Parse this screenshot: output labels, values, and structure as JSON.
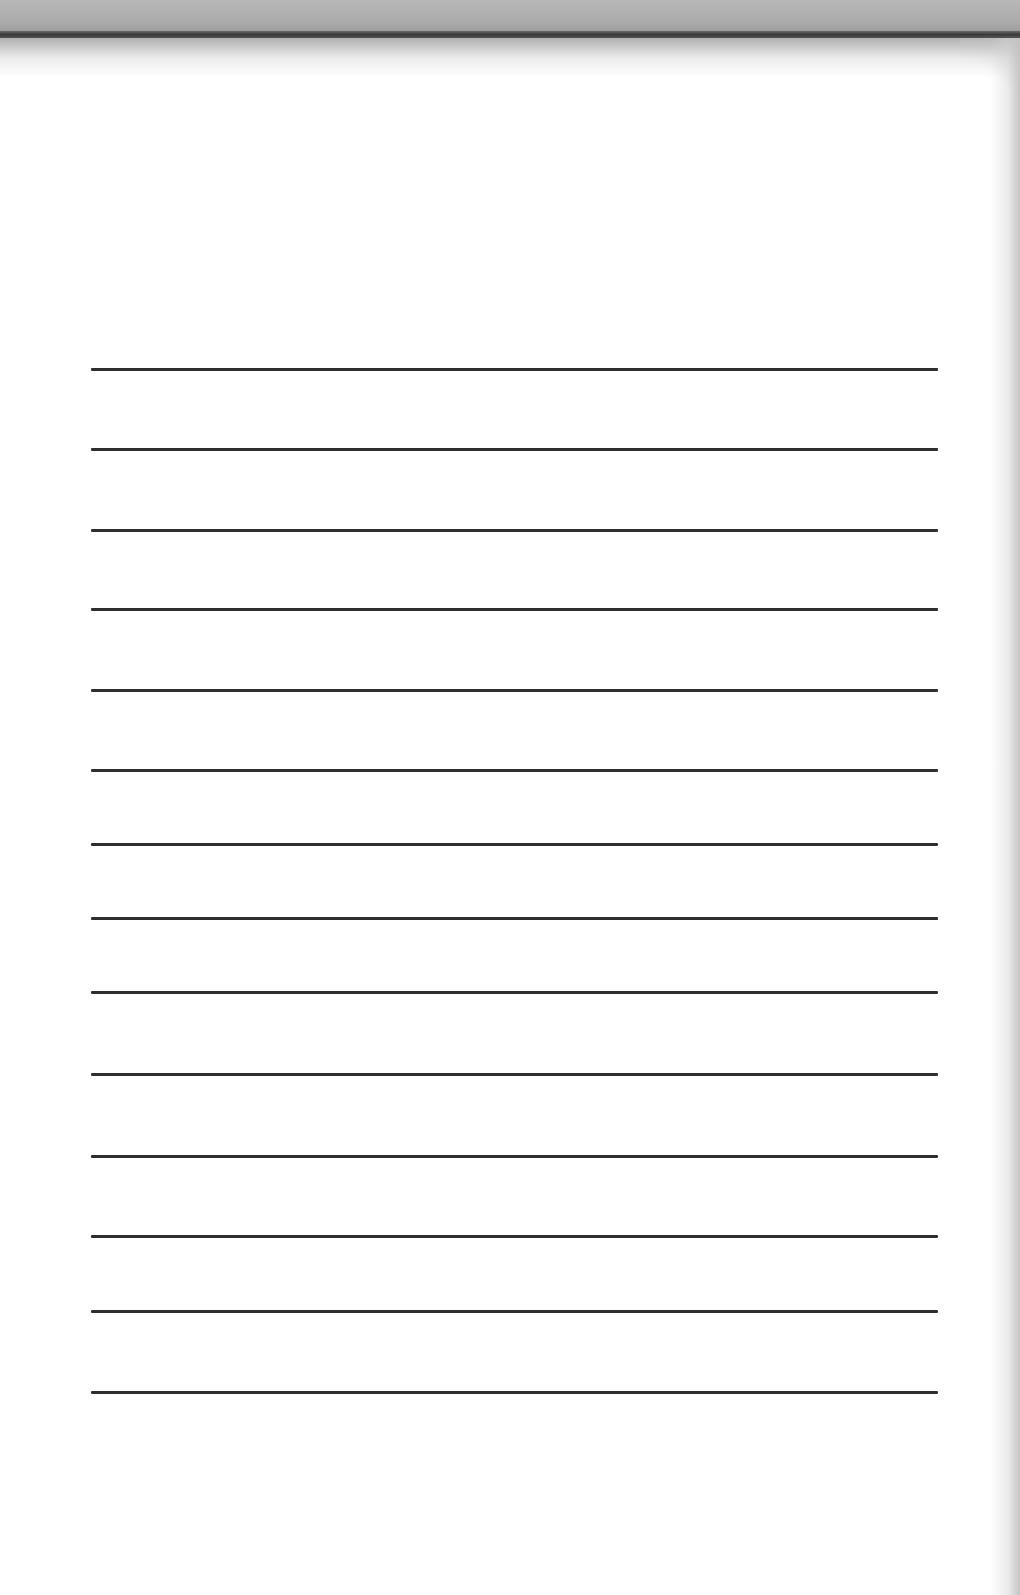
{
  "notepad": {
    "type": "blank lined sheet",
    "line_color": "#2e2e2e",
    "paper_color": "#ffffff",
    "binding_color": "#aaaaaa",
    "ruled_lines": [
      {
        "y": 368
      },
      {
        "y": 448
      },
      {
        "y": 529
      },
      {
        "y": 608
      },
      {
        "y": 689
      },
      {
        "y": 769
      },
      {
        "y": 843
      },
      {
        "y": 917
      },
      {
        "y": 991
      },
      {
        "y": 1073
      },
      {
        "y": 1155
      },
      {
        "y": 1235
      },
      {
        "y": 1310
      },
      {
        "y": 1391
      }
    ]
  }
}
